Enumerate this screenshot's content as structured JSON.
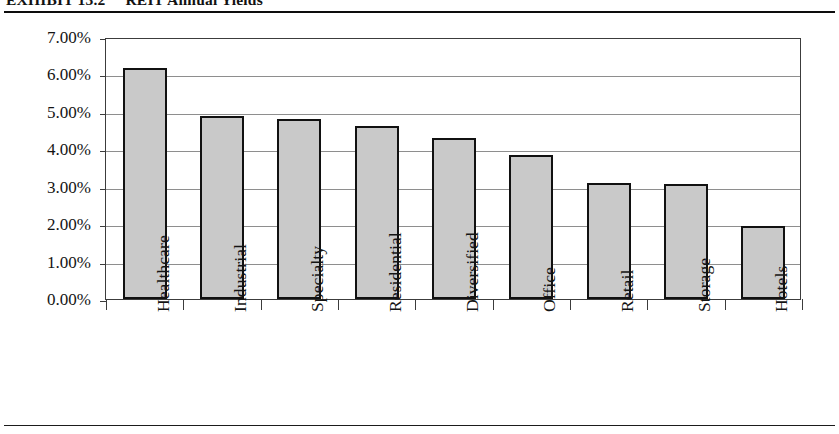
{
  "exhibit": {
    "number": "EXHIBIT 13.2",
    "title": "REIT Annual Yields"
  },
  "chart_data": {
    "type": "bar",
    "title": "REIT Annual Yields",
    "xlabel": "",
    "ylabel": "",
    "ylim": [
      0,
      7
    ],
    "grid": true,
    "legend": false,
    "y_tick_labels": [
      "7.00%",
      "6.00%",
      "5.00%",
      "4.00%",
      "3.00%",
      "2.00%",
      "1.00%",
      "0.00%"
    ],
    "y_tick_values": [
      7,
      6,
      5,
      4,
      3,
      2,
      1,
      0
    ],
    "categories": [
      "Healthcare",
      "Industrial",
      "Specialty",
      "Residential",
      "Diversified",
      "Office",
      "Retail",
      "Storage",
      "Hotels"
    ],
    "values": [
      6.18,
      4.9,
      4.8,
      4.62,
      4.3,
      3.84,
      3.1,
      3.07,
      1.96
    ],
    "value_labels": [
      "6.18%",
      "4.90%",
      "4.80%",
      "4.62%",
      "4.30%",
      "3.84%",
      "3.10%",
      "3.07%",
      "1.96%"
    ],
    "bar_color": "#c9c9c9",
    "bar_edge_color": "#111111",
    "gridline_color": "#8e8e8e",
    "axis_color": "#3c3c3c"
  }
}
